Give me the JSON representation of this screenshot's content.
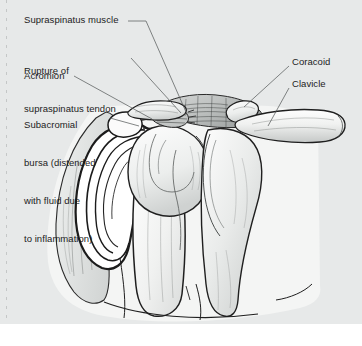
{
  "figure": {
    "type": "medical-illustration",
    "view": "anterior coronal section of right shoulder",
    "background_color": "#e7e9e9",
    "ink_color": "#1c1c1c",
    "bone_fill": "#f2f3f2",
    "canvas": {
      "width": 362,
      "height": 346
    }
  },
  "labels": {
    "left": [
      {
        "id": "supraspinatus-muscle",
        "lines": [
          "Supraspinatus muscle"
        ],
        "x": 24,
        "y": 14,
        "leader": "M128,21 L146,21 L186,112"
      },
      {
        "id": "rupture-of-supraspinatus-tendon",
        "lines": [
          "Rupture of",
          "supraspinatus tendon"
        ],
        "x": 24,
        "y": 40,
        "leader": "M131,58 L181,113"
      },
      {
        "id": "acromion",
        "lines": [
          "Acromion"
        ],
        "x": 24,
        "y": 70,
        "leader": "M74,76 L152,119"
      },
      {
        "id": "subacromial-bursa",
        "lines": [
          "Subacromial",
          "bursa (distended",
          "with fluid due",
          "to inflammation)"
        ],
        "x": 24,
        "y": 94,
        "leader": "M110,118 L139,126"
      }
    ],
    "right": [
      {
        "id": "coracoid",
        "lines": [
          "Coracoid"
        ],
        "x": 292,
        "y": 56,
        "leader": "M289,66 L244,107"
      },
      {
        "id": "clavicle",
        "lines": [
          "Clavicle"
        ],
        "x": 292,
        "y": 78,
        "leader": "M289,88 L268,126"
      }
    ]
  },
  "anatomy_parts": [
    "acromion",
    "clavicle",
    "coracoid process",
    "supraspinatus muscle",
    "ruptured supraspinatus tendon",
    "subacromial bursa (distended)",
    "humeral head",
    "humerus shaft",
    "glenoid",
    "scapula body",
    "deltoid muscle"
  ]
}
